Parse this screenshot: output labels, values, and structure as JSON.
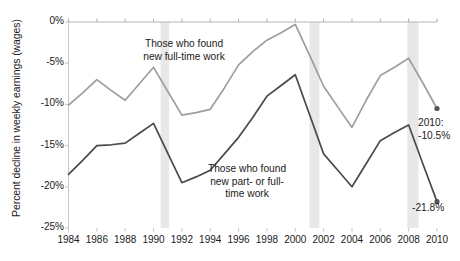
{
  "chart_data": {
    "type": "line",
    "title": "",
    "subtitle": "",
    "xlabel": "",
    "ylabel": "Percent decline in weekly earnings (wages)",
    "xlim": [
      1984,
      2010
    ],
    "ylim": [
      -25,
      0
    ],
    "grid": false,
    "legend_position": "inline-annotations",
    "y_ticks": [
      "0%",
      "-5%",
      "-10%",
      "-15%",
      "-20%",
      "-25%"
    ],
    "y_tick_values": [
      0,
      -5,
      -10,
      -15,
      -20,
      -25
    ],
    "x_ticks": [
      "1984",
      "1986",
      "1988",
      "1990",
      "1992",
      "1994",
      "1996",
      "1998",
      "2000",
      "2002",
      "2004",
      "2006",
      "2008",
      "2010"
    ],
    "x_tick_values": [
      1984,
      1986,
      1988,
      1990,
      1992,
      1994,
      1996,
      1998,
      2000,
      2002,
      2004,
      2006,
      2008,
      2010
    ],
    "series": [
      {
        "name": "Those who found new full-time work",
        "color": "#9e9e9e",
        "x": [
          1984,
          1985,
          1986,
          1987,
          1988,
          1989,
          1990,
          1991,
          1992,
          1993,
          1994,
          1995,
          1996,
          1997,
          1998,
          1999,
          2000,
          2001,
          2002,
          2003,
          2004,
          2005,
          2006,
          2007,
          2008,
          2009,
          2010
        ],
        "values": [
          -10.1,
          -8.6,
          -7.0,
          -8.3,
          -9.5,
          -7.5,
          -5.5,
          -8.4,
          -11.3,
          -11.0,
          -10.6,
          -8.0,
          -5.2,
          -3.6,
          -2.2,
          -1.3,
          -0.3,
          -4.0,
          -7.8,
          -10.3,
          -12.8,
          -9.5,
          -6.5,
          -5.5,
          -4.4,
          -7.4,
          -10.5
        ]
      },
      {
        "name": "Those who found new part- or full-time work",
        "color": "#4a4a4a",
        "x": [
          1984,
          1985,
          1986,
          1987,
          1988,
          1989,
          1990,
          1991,
          1992,
          1993,
          1994,
          1995,
          1996,
          1997,
          1998,
          1999,
          2000,
          2001,
          2002,
          2003,
          2004,
          2005,
          2006,
          2007,
          2008,
          2009,
          2010
        ],
        "values": [
          -18.5,
          -16.8,
          -15.0,
          -14.9,
          -14.7,
          -13.5,
          -12.3,
          -15.9,
          -19.5,
          -18.8,
          -18.0,
          -16.0,
          -14.0,
          -11.6,
          -9.0,
          -7.7,
          -6.4,
          -11.2,
          -16.0,
          -18.0,
          -20.0,
          -17.2,
          -14.4,
          -13.4,
          -12.5,
          -17.2,
          -21.8
        ]
      }
    ],
    "shaded_bands": [
      {
        "name": "recession-1990-1991",
        "start": 1990.5,
        "end": 1991.1
      },
      {
        "name": "recession-2001",
        "start": 2001.0,
        "end": 2001.7
      },
      {
        "name": "recession-2008-2009",
        "start": 2007.9,
        "end": 2008.7
      }
    ],
    "band_color": "#e8e8e8",
    "annotations": [
      {
        "name": "full-time-label",
        "lines": [
          "Those who found",
          "new full-time work"
        ],
        "x": 184,
        "y": 38
      },
      {
        "name": "part-or-full-time-label",
        "lines": [
          "Those who found",
          "new part- or full-",
          "time work"
        ],
        "x": 247,
        "y": 163
      },
      {
        "name": "endpoint-label-full-time",
        "lines": [
          "2010:",
          "-10.5%"
        ],
        "x": 418,
        "y": 117
      },
      {
        "name": "endpoint-label-part-or-full-time",
        "lines": [
          "-21.8%"
        ],
        "x": 412,
        "y": 202
      }
    ],
    "endpoints": [
      {
        "name": "full-time-2010-marker",
        "year": 2010,
        "value": -10.5
      },
      {
        "name": "part-or-full-time-2010-marker",
        "year": 2010,
        "value": -21.8
      }
    ]
  }
}
